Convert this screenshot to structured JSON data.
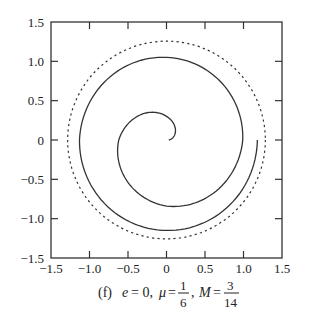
{
  "chart_data": {
    "type": "line",
    "title": "",
    "caption": {
      "label": "(f)",
      "e_text": "e = 0,",
      "mu_symbol": "μ",
      "mu_num": "1",
      "mu_den": "6",
      "M_symbol": "M",
      "M_num": "3",
      "M_den": "14",
      "full": "(f) e = 0, μ = 1/6, M = 3/14"
    },
    "xlabel": "",
    "ylabel": "",
    "xlim": [
      -1.5,
      1.5
    ],
    "ylim": [
      -1.5,
      1.5
    ],
    "x_ticks": [
      -1.5,
      -1.0,
      -0.5,
      0,
      0.5,
      1.0,
      1.5
    ],
    "x_tick_labels": [
      "−1.5",
      "−1.0",
      "−0.5",
      "0",
      "0.5",
      "1.0",
      "1.5"
    ],
    "y_ticks": [
      1.5,
      1.0,
      0.5,
      0,
      -0.5,
      -1.0,
      -1.5
    ],
    "y_tick_labels": [
      "1.5",
      "1.0",
      "0.5",
      "0",
      "−0.5",
      "−1.0",
      "−1.5"
    ],
    "grid": false,
    "legend": null,
    "series": [
      {
        "name": "trajectory (spiral)",
        "style": "solid",
        "color": "#333333",
        "anchor_points": [
          {
            "angle_deg": 0,
            "r": 0.03
          },
          {
            "angle_deg": 90,
            "r": 0.3
          },
          {
            "angle_deg": 180,
            "r": 0.62
          },
          {
            "angle_deg": 270,
            "r": 0.84
          },
          {
            "angle_deg": 360,
            "r": 0.99
          },
          {
            "angle_deg": 450,
            "r": 1.05
          },
          {
            "angle_deg": 540,
            "r": 1.13
          },
          {
            "angle_deg": 630,
            "r": 1.15
          },
          {
            "angle_deg": 720,
            "r": 1.18
          }
        ],
        "start": [
          0.03,
          0.0
        ],
        "end": [
          1.18,
          0.0
        ]
      },
      {
        "name": "limiting circle",
        "style": "dashed",
        "color": "#333333",
        "center": [
          0,
          0
        ],
        "radius": 1.27
      }
    ]
  }
}
